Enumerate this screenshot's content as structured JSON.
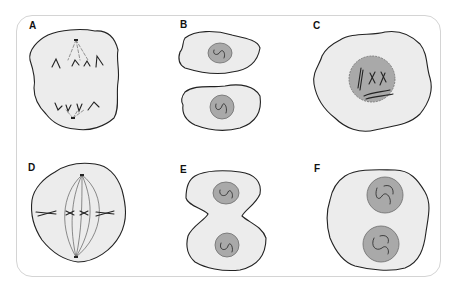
{
  "figure": {
    "colors": {
      "cytoplasm": "#ececec",
      "nucleus": "#a9a9a9",
      "outline": "#222222",
      "frame": "#d4d4d4"
    },
    "panels": [
      {
        "label": "A",
        "content": "anaphase: chromosomes pulled to opposite poles"
      },
      {
        "label": "B",
        "content": "two separate daughter cells, each with a nucleus"
      },
      {
        "label": "C",
        "content": "prophase: condensed chromosomes inside nucleus"
      },
      {
        "label": "D",
        "content": "metaphase: chromosomes aligned at equator with spindle"
      },
      {
        "label": "E",
        "content": "telophase/cytokinesis: cell pinching into two, two nuclei"
      },
      {
        "label": "F",
        "content": "telophase: single cell with two nuclei"
      }
    ]
  }
}
